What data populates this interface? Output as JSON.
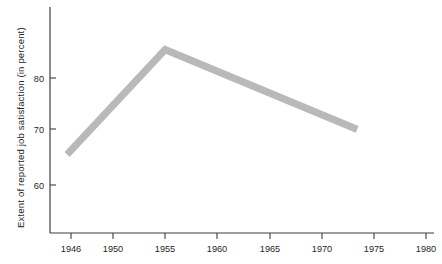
{
  "chart_data": {
    "type": "line",
    "title": "",
    "subtitle": "",
    "xlabel": "",
    "ylabel": "Extent of reported job satisfaction (in percent)",
    "grid": false,
    "legend": "none",
    "xlim": [
      1945.5,
      1980
    ],
    "ylim": [
      54,
      88
    ],
    "x_tick_labels": [
      "1946",
      "1950",
      "1955",
      "1960",
      "1965",
      "1970",
      "1975",
      "1980"
    ],
    "x_ticks": [
      1946,
      1950,
      1955,
      1960,
      1965,
      1970,
      1975,
      1980
    ],
    "y_tick_labels": [
      "60",
      "70",
      "80"
    ],
    "y_ticks": [
      60,
      70,
      80
    ],
    "series": [
      {
        "name": "Reported job satisfaction",
        "color": "#b9b9b9",
        "x": [
          1945.6,
          1955.0,
          1973.4
        ],
        "values": [
          65.7,
          85.3,
          70.4
        ]
      }
    ]
  },
  "axes": {
    "axis_color": "#3c3c3c",
    "tick_length": 5,
    "plot_left": 50,
    "plot_right": 434,
    "plot_top": 7,
    "plot_bottom": 233
  }
}
